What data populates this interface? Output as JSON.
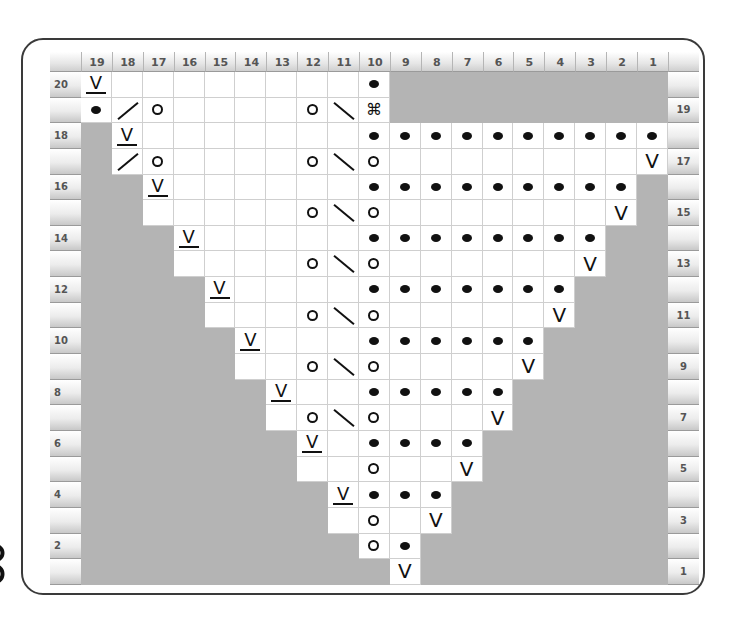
{
  "chart_title": "",
  "column_labels": [
    "19",
    "18",
    "17",
    "16",
    "15",
    "14",
    "13",
    "12",
    "11",
    "10",
    "9",
    "8",
    "7",
    "6",
    "5",
    "4",
    "3",
    "2",
    "1"
  ],
  "row_labels_left": {
    "20": "20",
    "18": "18",
    "16": "16",
    "14": "14",
    "12": "12",
    "10": "10",
    "8": "8",
    "6": "6",
    "4": "4",
    "2": "2"
  },
  "row_labels_right": {
    "19": "19",
    "17": "17",
    "15": "15",
    "13": "13",
    "11": "11",
    "9": "9",
    "7": "7",
    "5": "5",
    "3": "3",
    "1": "1"
  },
  "legend_symbols": {
    "Vu": "slip stitch (underlined V)",
    "V": "V stitch",
    "D": "purl (dot)",
    "O": "yarn over",
    "/": "decrease right",
    "\\": "decrease left",
    "K": "special stitch (⌘)",
    "_": "knit (blank)",
    "g": "no stitch (gray)"
  },
  "special_glyph": "⌘",
  "vee_glyph": "V",
  "colors": {
    "no_stitch": "#b4b4b4",
    "grid_line": "#cfcfcf",
    "frame": "#3a3a3a",
    "symbol": "#111111"
  },
  "rows": [
    {
      "row": 20,
      "cells": [
        "Vu",
        "_",
        "_",
        "_",
        "_",
        "_",
        "_",
        "_",
        "_",
        "D",
        "g",
        "g",
        "g",
        "g",
        "g",
        "g",
        "g",
        "g",
        "g"
      ]
    },
    {
      "row": 19,
      "cells": [
        "D",
        "/",
        "O",
        "_",
        "_",
        "_",
        "_",
        "O",
        "\\",
        "K",
        "g",
        "g",
        "g",
        "g",
        "g",
        "g",
        "g",
        "g",
        "g"
      ]
    },
    {
      "row": 18,
      "cells": [
        "g",
        "Vu",
        "_",
        "_",
        "_",
        "_",
        "_",
        "_",
        "_",
        "D",
        "D",
        "D",
        "D",
        "D",
        "D",
        "D",
        "D",
        "D",
        "D"
      ]
    },
    {
      "row": 17,
      "cells": [
        "g",
        "/",
        "O",
        "_",
        "_",
        "_",
        "_",
        "O",
        "\\",
        "O",
        "_",
        "_",
        "_",
        "_",
        "_",
        "_",
        "_",
        "_",
        "V"
      ]
    },
    {
      "row": 16,
      "cells": [
        "g",
        "g",
        "Vu",
        "_",
        "_",
        "_",
        "_",
        "_",
        "_",
        "D",
        "D",
        "D",
        "D",
        "D",
        "D",
        "D",
        "D",
        "D",
        "g"
      ]
    },
    {
      "row": 15,
      "cells": [
        "g",
        "g",
        "_",
        "_",
        "_",
        "_",
        "_",
        "O",
        "\\",
        "O",
        "_",
        "_",
        "_",
        "_",
        "_",
        "_",
        "_",
        "V",
        "g"
      ]
    },
    {
      "row": 14,
      "cells": [
        "g",
        "g",
        "g",
        "Vu",
        "_",
        "_",
        "_",
        "_",
        "_",
        "D",
        "D",
        "D",
        "D",
        "D",
        "D",
        "D",
        "D",
        "g",
        "g"
      ]
    },
    {
      "row": 13,
      "cells": [
        "g",
        "g",
        "g",
        "_",
        "_",
        "_",
        "_",
        "O",
        "\\",
        "O",
        "_",
        "_",
        "_",
        "_",
        "_",
        "_",
        "V",
        "g",
        "g"
      ]
    },
    {
      "row": 12,
      "cells": [
        "g",
        "g",
        "g",
        "g",
        "Vu",
        "_",
        "_",
        "_",
        "_",
        "D",
        "D",
        "D",
        "D",
        "D",
        "D",
        "D",
        "g",
        "g",
        "g"
      ]
    },
    {
      "row": 11,
      "cells": [
        "g",
        "g",
        "g",
        "g",
        "_",
        "_",
        "_",
        "O",
        "\\",
        "O",
        "_",
        "_",
        "_",
        "_",
        "_",
        "V",
        "g",
        "g",
        "g"
      ]
    },
    {
      "row": 10,
      "cells": [
        "g",
        "g",
        "g",
        "g",
        "g",
        "Vu",
        "_",
        "_",
        "_",
        "D",
        "D",
        "D",
        "D",
        "D",
        "D",
        "g",
        "g",
        "g",
        "g"
      ]
    },
    {
      "row": 9,
      "cells": [
        "g",
        "g",
        "g",
        "g",
        "g",
        "_",
        "_",
        "O",
        "\\",
        "O",
        "_",
        "_",
        "_",
        "_",
        "V",
        "g",
        "g",
        "g",
        "g"
      ]
    },
    {
      "row": 8,
      "cells": [
        "g",
        "g",
        "g",
        "g",
        "g",
        "g",
        "Vu",
        "_",
        "_",
        "D",
        "D",
        "D",
        "D",
        "D",
        "g",
        "g",
        "g",
        "g",
        "g"
      ]
    },
    {
      "row": 7,
      "cells": [
        "g",
        "g",
        "g",
        "g",
        "g",
        "g",
        "_",
        "O",
        "\\",
        "O",
        "_",
        "_",
        "_",
        "V",
        "g",
        "g",
        "g",
        "g",
        "g"
      ]
    },
    {
      "row": 6,
      "cells": [
        "g",
        "g",
        "g",
        "g",
        "g",
        "g",
        "g",
        "Vu",
        "_",
        "D",
        "D",
        "D",
        "D",
        "g",
        "g",
        "g",
        "g",
        "g",
        "g"
      ]
    },
    {
      "row": 5,
      "cells": [
        "g",
        "g",
        "g",
        "g",
        "g",
        "g",
        "g",
        "_",
        "_",
        "O",
        "_",
        "_",
        "V",
        "g",
        "g",
        "g",
        "g",
        "g",
        "g"
      ]
    },
    {
      "row": 4,
      "cells": [
        "g",
        "g",
        "g",
        "g",
        "g",
        "g",
        "g",
        "g",
        "Vu",
        "D",
        "D",
        "D",
        "g",
        "g",
        "g",
        "g",
        "g",
        "g",
        "g"
      ]
    },
    {
      "row": 3,
      "cells": [
        "g",
        "g",
        "g",
        "g",
        "g",
        "g",
        "g",
        "g",
        "_",
        "O",
        "_",
        "V",
        "g",
        "g",
        "g",
        "g",
        "g",
        "g",
        "g"
      ]
    },
    {
      "row": 2,
      "cells": [
        "g",
        "g",
        "g",
        "g",
        "g",
        "g",
        "g",
        "g",
        "g",
        "O",
        "D",
        "g",
        "g",
        "g",
        "g",
        "g",
        "g",
        "g",
        "g"
      ]
    },
    {
      "row": 1,
      "cells": [
        "g",
        "g",
        "g",
        "g",
        "g",
        "g",
        "g",
        "g",
        "g",
        "g",
        "V",
        "g",
        "g",
        "g",
        "g",
        "g",
        "g",
        "g",
        "g"
      ]
    }
  ]
}
